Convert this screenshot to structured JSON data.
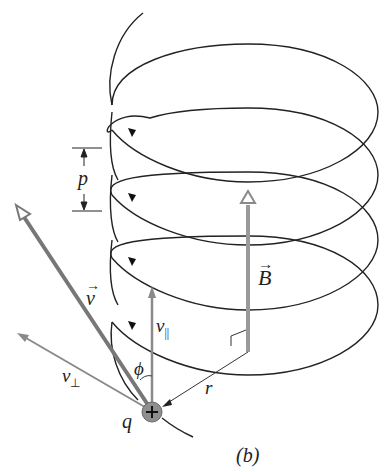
{
  "diagram": {
    "caption": "(b)",
    "labels": {
      "pitch": "p",
      "velocity": "v",
      "magnetic_field": "B",
      "v_parallel_base": "v",
      "v_parallel_sub": "||",
      "v_perp_base": "v",
      "v_perp_sub": "⊥",
      "angle": "ϕ",
      "radius": "r",
      "charge": "q",
      "charge_sign": "+"
    },
    "colors": {
      "helix": "#222222",
      "vector": "#7a7a7a",
      "particle": "#8c8c8c"
    }
  }
}
